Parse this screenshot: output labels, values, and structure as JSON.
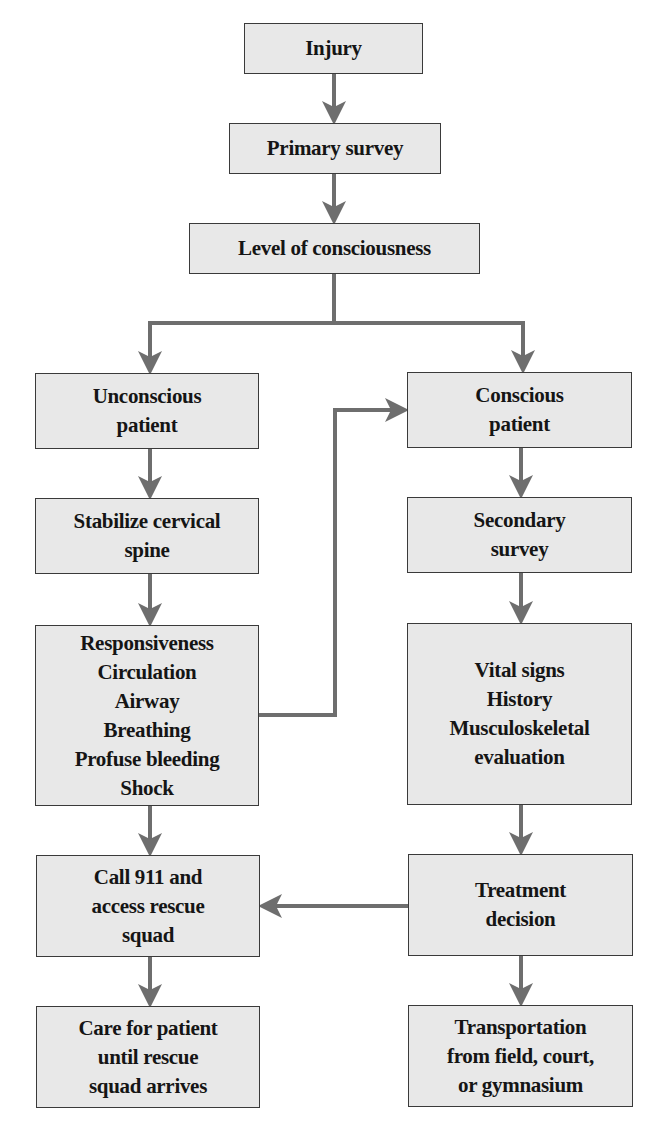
{
  "diagram": {
    "type": "flowchart",
    "colors": {
      "box_fill": "#e8e8e8",
      "box_border": "#3a3a3a",
      "arrow": "#6e6e6e",
      "text": "#151515",
      "background": "#ffffff"
    },
    "nodes": {
      "injury": {
        "lines": [
          "Injury"
        ]
      },
      "primary_survey": {
        "lines": [
          "Primary survey"
        ]
      },
      "level_of_consciousness": {
        "lines": [
          "Level of consciousness"
        ]
      },
      "unconscious_patient": {
        "lines": [
          "Unconscious",
          "patient"
        ]
      },
      "conscious_patient": {
        "lines": [
          "Conscious",
          "patient"
        ]
      },
      "stabilize_cervical_spine": {
        "lines": [
          "Stabilize cervical",
          "spine"
        ]
      },
      "secondary_survey": {
        "lines": [
          "Secondary",
          "survey"
        ]
      },
      "unconscious_checks": {
        "lines": [
          "Responsiveness",
          "Circulation",
          "Airway",
          "Breathing",
          "Profuse bleeding",
          "Shock"
        ]
      },
      "conscious_evaluation": {
        "lines": [
          "Vital signs",
          "History",
          "Musculoskeletal",
          "evaluation"
        ]
      },
      "call_911": {
        "lines": [
          "Call 911 and",
          "access rescue",
          "squad"
        ]
      },
      "treatment_decision": {
        "lines": [
          "Treatment",
          "decision"
        ]
      },
      "care_for_patient": {
        "lines": [
          "Care for patient",
          "until rescue",
          "squad arrives"
        ]
      },
      "transportation": {
        "lines": [
          "Transportation",
          "from field, court,",
          "or gymnasium"
        ]
      }
    },
    "edges": [
      {
        "from": "Injury",
        "to": "Primary survey"
      },
      {
        "from": "Primary survey",
        "to": "Level of consciousness"
      },
      {
        "from": "Level of consciousness",
        "to": "Unconscious patient"
      },
      {
        "from": "Level of consciousness",
        "to": "Conscious patient"
      },
      {
        "from": "Unconscious patient",
        "to": "Stabilize cervical spine"
      },
      {
        "from": "Stabilize cervical spine",
        "to": "Responsiveness / Circulation / Airway / Breathing / Profuse bleeding / Shock"
      },
      {
        "from": "Responsiveness / Circulation / Airway / Breathing / Profuse bleeding / Shock",
        "to": "Conscious patient"
      },
      {
        "from": "Responsiveness / Circulation / Airway / Breathing / Profuse bleeding / Shock",
        "to": "Call 911 and access rescue squad"
      },
      {
        "from": "Conscious patient",
        "to": "Secondary survey"
      },
      {
        "from": "Secondary survey",
        "to": "Vital signs / History / Musculoskeletal evaluation"
      },
      {
        "from": "Vital signs / History / Musculoskeletal evaluation",
        "to": "Treatment decision"
      },
      {
        "from": "Treatment decision",
        "to": "Call 911 and access rescue squad"
      },
      {
        "from": "Treatment decision",
        "to": "Transportation from field, court, or gymnasium"
      },
      {
        "from": "Call 911 and access rescue squad",
        "to": "Care for patient until rescue squad arrives"
      }
    ]
  }
}
